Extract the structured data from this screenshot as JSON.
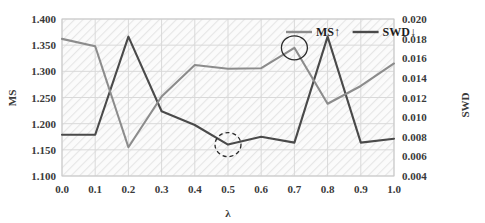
{
  "chart_data": {
    "type": "line",
    "title": "",
    "xlabel": "λ",
    "x": [
      0.0,
      0.1,
      0.2,
      0.3,
      0.4,
      0.5,
      0.6,
      0.7,
      0.8,
      0.9,
      1.0
    ],
    "xtick_labels": [
      "0.0",
      "0.1",
      "0.2",
      "0.3",
      "0.4",
      "0.5",
      "0.6",
      "0.7",
      "0.8",
      "0.9",
      "1.0"
    ],
    "xlim": [
      0.0,
      1.0
    ],
    "grid": true,
    "legend_position": "top-right",
    "series": [
      {
        "name": "MS↑",
        "axis": "left",
        "color": "#8c8c8c",
        "values": [
          1.362,
          1.348,
          1.155,
          1.252,
          1.312,
          1.305,
          1.306,
          1.345,
          1.238,
          1.272,
          1.315
        ]
      },
      {
        "name": "SWD↓",
        "axis": "right",
        "color": "#4a4a4a",
        "values": [
          0.0082,
          0.0082,
          0.0182,
          0.0106,
          0.0092,
          0.0072,
          0.008,
          0.0074,
          0.0182,
          0.0074,
          0.0078
        ]
      }
    ],
    "left_axis": {
      "label": "MS",
      "ylim": [
        1.1,
        1.4
      ],
      "ticks": [
        1.1,
        1.15,
        1.2,
        1.25,
        1.3,
        1.35,
        1.4
      ],
      "tick_labels": [
        "1.100",
        "1.150",
        "1.200",
        "1.250",
        "1.300",
        "1.350",
        "1.400"
      ]
    },
    "right_axis": {
      "label": "SWD",
      "ylim": [
        0.004,
        0.02
      ],
      "ticks": [
        0.004,
        0.006,
        0.008,
        0.01,
        0.012,
        0.014,
        0.016,
        0.018,
        0.02
      ],
      "tick_labels": [
        "0.004",
        "0.006",
        "0.008",
        "0.010",
        "0.012",
        "0.014",
        "0.016",
        "0.018",
        "0.020"
      ]
    },
    "annotations": [
      {
        "kind": "solid-circle",
        "target_series": "MS↑",
        "x": 0.7,
        "y": 1.345,
        "note": "MS maximum"
      },
      {
        "kind": "dashed-circle",
        "target_series": "SWD↓",
        "x": 0.5,
        "y": 0.0072,
        "note": "SWD minimum"
      }
    ]
  },
  "legend": {
    "items": [
      {
        "label": "MS↑",
        "color": "#8c8c8c"
      },
      {
        "label": "SWD↓",
        "color": "#4a4a4a"
      }
    ]
  },
  "axis_titles": {
    "left": "MS",
    "right": "SWD",
    "bottom": "λ"
  },
  "colors": {
    "ms_line": "#8c8c8c",
    "swd_line": "#4a4a4a",
    "grid": "#d9d9d9",
    "plot_hatch": "#ececec",
    "text": "#3a3a3a",
    "frame": "#bdbdbd"
  }
}
